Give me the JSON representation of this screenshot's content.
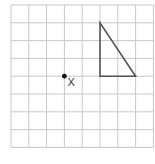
{
  "diagram": {
    "grid": {
      "columns": 8,
      "rows": 8,
      "line_color": "#c8c8c8"
    },
    "triangle": {
      "stroke_color": "#555555",
      "vertices_grid": [
        [
          5,
          1
        ],
        [
          5,
          4
        ],
        [
          7,
          4
        ]
      ]
    },
    "point": {
      "label": "X",
      "grid_position": [
        3,
        4
      ],
      "color": "#111111"
    }
  }
}
